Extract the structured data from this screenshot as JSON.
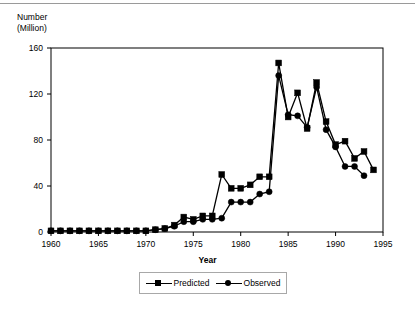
{
  "figure": {
    "background": "#ffffff",
    "line_color": "#000000",
    "border_color": "#000000"
  },
  "axes": {
    "y_title_line1": "Number",
    "y_title_line2": "(Million)",
    "x_title": "Year",
    "y_ticks": [
      0,
      40,
      80,
      120,
      160
    ],
    "x_ticks": [
      1960,
      1965,
      1970,
      1975,
      1980,
      1985,
      1990,
      1995
    ],
    "ylim": [
      0,
      160
    ],
    "xlim": [
      1960,
      1995
    ]
  },
  "legend": {
    "position": "below-axis",
    "entries": [
      {
        "label": "Predicted",
        "marker": "square",
        "color": "#000000"
      },
      {
        "label": "Observed",
        "marker": "circle",
        "color": "#000000"
      }
    ]
  },
  "chart_data": {
    "type": "line",
    "title": "",
    "xlabel": "Year",
    "ylabel": "Number (Million)",
    "xlim": [
      1960,
      1995
    ],
    "ylim": [
      0,
      160
    ],
    "grid": false,
    "legend_position": "bottom",
    "x": [
      1960,
      1961,
      1962,
      1963,
      1964,
      1965,
      1966,
      1967,
      1968,
      1969,
      1970,
      1971,
      1972,
      1973,
      1974,
      1975,
      1976,
      1977,
      1978,
      1979,
      1980,
      1981,
      1982,
      1983,
      1984,
      1985,
      1986,
      1987,
      1988,
      1989,
      1990,
      1991,
      1992,
      1993,
      1994
    ],
    "series": [
      {
        "name": "Predicted",
        "marker": "square",
        "color": "#000000",
        "values": [
          1,
          1,
          1,
          1,
          1,
          1,
          1,
          1,
          1,
          1,
          1,
          2,
          3,
          6,
          13,
          11,
          14,
          14,
          50,
          38,
          38,
          41,
          48,
          48,
          147,
          100,
          121,
          90,
          130,
          96,
          76,
          79,
          64,
          70,
          54
        ]
      },
      {
        "name": "Observed",
        "marker": "circle",
        "color": "#000000",
        "values": [
          1,
          1,
          1,
          1,
          1,
          1,
          1,
          1,
          1,
          1,
          1,
          2,
          3,
          5,
          9,
          9,
          11,
          11,
          12,
          26,
          26,
          26,
          33,
          35,
          136,
          102,
          101,
          91,
          126,
          89,
          74,
          57,
          57,
          49,
          null
        ]
      }
    ]
  }
}
